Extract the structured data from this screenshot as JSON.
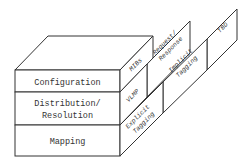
{
  "diagram": {
    "type": "layered-block",
    "front_layers": [
      {
        "label_lines": [
          "Configuration"
        ]
      },
      {
        "label_lines": [
          "Distribution/",
          "Resolution"
        ]
      },
      {
        "label_lines": [
          "Mapping"
        ]
      }
    ],
    "side_panels": [
      {
        "name": "mibs",
        "label_lines": [
          "MIBs"
        ]
      },
      {
        "name": "vlmp",
        "label_lines": [
          "VLMP"
        ]
      },
      {
        "name": "explicit-tagging",
        "label_lines": [
          "Explicit",
          "Tagging"
        ]
      },
      {
        "name": "request-response",
        "label_lines": [
          "Request/",
          "Response"
        ]
      },
      {
        "name": "implicit-tagging",
        "label_lines": [
          "Implicit",
          "Tagging"
        ]
      },
      {
        "name": "tbd",
        "label_lines": [
          "TBD"
        ]
      }
    ],
    "colors": {
      "stroke": "#333333",
      "fill": "#ffffff"
    }
  }
}
